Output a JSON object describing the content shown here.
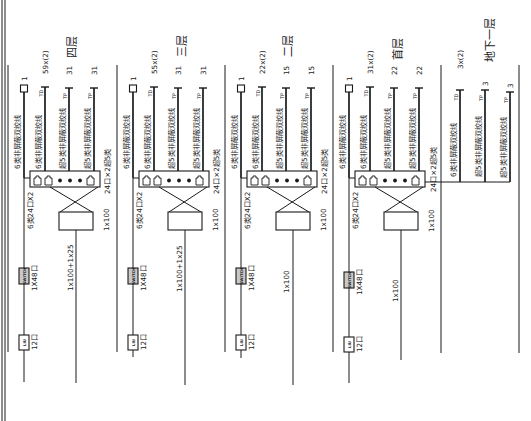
{
  "colors": {
    "line": "#1a1a1a",
    "background": "#ffffff",
    "switch_fill": "#c8c8c8"
  },
  "floors": [
    {
      "label": "四层",
      "outlets": [
        {
          "symbol": "square-outlet",
          "count": "1",
          "cable": "6类非屏蔽双绞线"
        },
        {
          "symbol": "TD",
          "count": "59x(2)",
          "cable": "6类非屏蔽双绞线"
        },
        {
          "symbol": "TP",
          "count": "31",
          "cable": "超5类非屏蔽双绞线"
        },
        {
          "symbol": "TP",
          "count": "31",
          "cable": "超5类非屏蔽双绞线"
        }
      ],
      "patch_panel_label": "24口×2超5类",
      "cat6_panel_label": "6类24口X2",
      "switch": {
        "symbol": "SWITCH",
        "ports": "1X48口"
      },
      "fiber_box": {
        "symbol": "LIU",
        "ports": "12口"
      },
      "voice_panel_label": "1x100",
      "voice_backbone_label": "1x100+1x25"
    },
    {
      "label": "三层",
      "outlets": [
        {
          "symbol": "square-outlet",
          "count": "1",
          "cable": "6类非屏蔽双绞线"
        },
        {
          "symbol": "TD",
          "count": "55x(2)",
          "cable": "6类非屏蔽双绞线"
        },
        {
          "symbol": "TP",
          "count": "31",
          "cable": "超5类非屏蔽双绞线"
        },
        {
          "symbol": "TP",
          "count": "31",
          "cable": "超5类非屏蔽双绞线"
        }
      ],
      "patch_panel_label": "24口×2超5类",
      "cat6_panel_label": "6类24口X2",
      "switch": {
        "symbol": "SWITCH",
        "ports": "1X48口"
      },
      "fiber_box": {
        "symbol": "LIU",
        "ports": "12口"
      },
      "voice_panel_label": "1x100",
      "voice_backbone_label": "1x100+1x25"
    },
    {
      "label": "二层",
      "outlets": [
        {
          "symbol": "square-outlet",
          "count": "1",
          "cable": "6类非屏蔽双绞线"
        },
        {
          "symbol": "TD",
          "count": "22x(2)",
          "cable": "6类非屏蔽双绞线"
        },
        {
          "symbol": "TP",
          "count": "15",
          "cable": "超5类非屏蔽双绞线"
        },
        {
          "symbol": "TP",
          "count": "15",
          "cable": "超5类非屏蔽双绞线"
        }
      ],
      "patch_panel_label": "24口×2超5类",
      "cat6_panel_label": "6类24口X2",
      "switch": {
        "symbol": "SWITCH",
        "ports": "1X48口"
      },
      "fiber_box": {
        "symbol": "LIU",
        "ports": "12口"
      },
      "voice_panel_label": "1x100",
      "voice_backbone_label": "1x100"
    },
    {
      "label": "首层",
      "outlets": [
        {
          "symbol": "square-outlet",
          "count": "1",
          "cable": "6类非屏蔽双绞线"
        },
        {
          "symbol": "TD",
          "count": "31x(2)",
          "cable": "6类非屏蔽双绞线"
        },
        {
          "symbol": "TP",
          "count": "22",
          "cable": "超5类非屏蔽双绞线"
        },
        {
          "symbol": "TP",
          "count": "22",
          "cable": "超5类非屏蔽双绞线"
        }
      ],
      "patch_panel_label": "24口×2超5类",
      "cat6_panel_label": "6类24口X2",
      "switch": {
        "symbol": "SWITCH",
        "ports": "1X48口"
      },
      "fiber_box": {
        "symbol": "LIU",
        "ports": "12口"
      },
      "voice_panel_label": "1x100",
      "voice_backbone_label": "1x100"
    }
  ],
  "basement": {
    "label": "地下一层",
    "outlets": [
      {
        "symbol": "TD",
        "count": "3x(2)",
        "cable": "6类非屏蔽双绞线"
      },
      {
        "symbol": "TP",
        "count": "3",
        "cable": "超5类非屏蔽双绞线"
      },
      {
        "symbol": "TP",
        "count": "3",
        "cable": "超5类非屏蔽双绞线"
      }
    ]
  }
}
